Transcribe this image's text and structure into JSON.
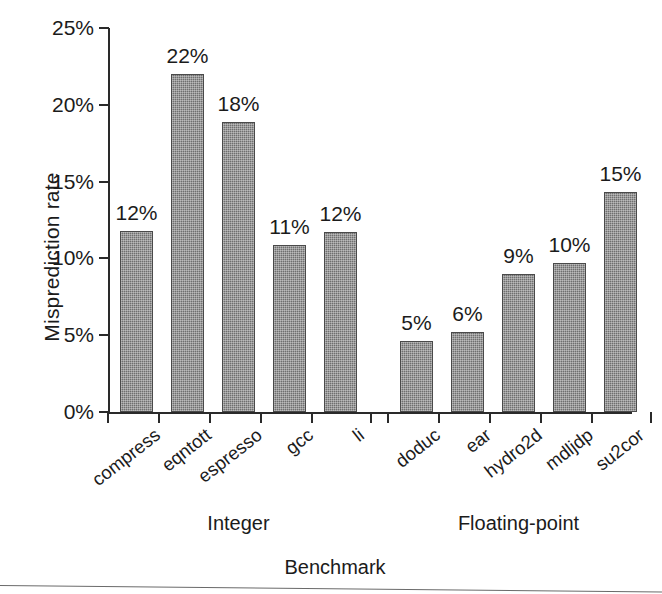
{
  "chart_data": {
    "type": "bar",
    "title": "",
    "xlabel": "Benchmark",
    "ylabel": "Misprediction rate",
    "categories": [
      "compress",
      "eqntott",
      "espresso",
      "gcc",
      "li",
      "doduc",
      "ear",
      "hydro2d",
      "mdljdp",
      "su2cor"
    ],
    "values": [
      11.8,
      22.0,
      18.9,
      10.9,
      11.7,
      4.6,
      5.2,
      9.0,
      9.7,
      14.3
    ],
    "data_labels": [
      "12%",
      "22%",
      "18%",
      "11%",
      "12%",
      "5%",
      "6%",
      "9%",
      "10%",
      "15%"
    ],
    "groups": [
      {
        "label": "Integer",
        "members": [
          "compress",
          "eqntott",
          "espresso",
          "gcc",
          "li"
        ]
      },
      {
        "label": "Floating-point",
        "members": [
          "doduc",
          "ear",
          "hydro2d",
          "mdljdp",
          "su2cor"
        ]
      }
    ],
    "ylim": [
      0,
      25
    ],
    "ytick_labels": [
      "0%",
      "5%",
      "10%",
      "15%",
      "20%",
      "25%"
    ],
    "ytick_values": [
      0,
      5,
      10,
      15,
      20,
      25
    ],
    "grid": false,
    "legend": "none",
    "bar_color": "#6f6f6f",
    "axis_color": "#2a2a2a",
    "text_color": "#1b1b1b",
    "background_color": "#ffffff"
  }
}
